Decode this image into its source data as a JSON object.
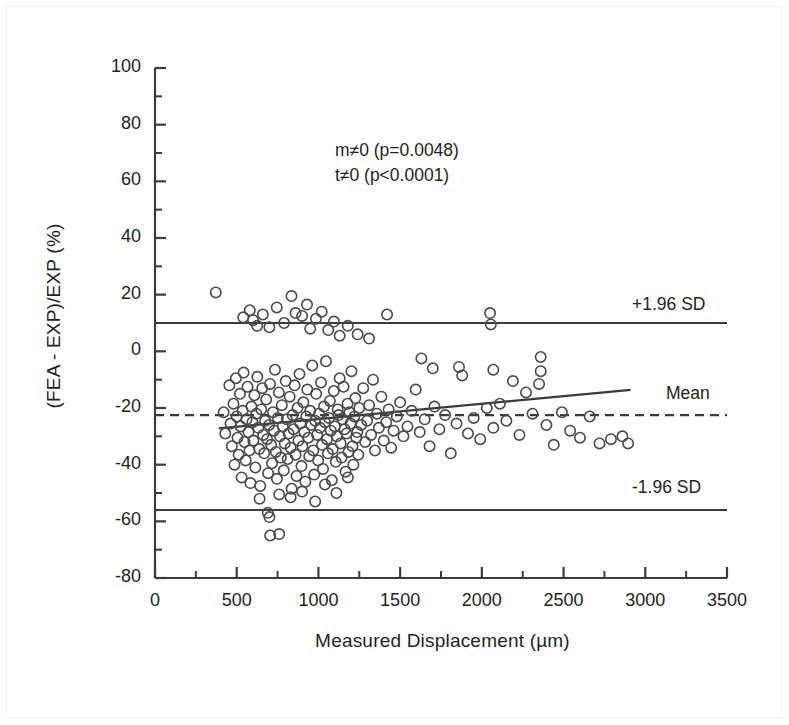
{
  "figure": {
    "border_color": "#f2f2f2",
    "background": "#ffffff",
    "ink_color": "#3b3b3b",
    "text_color": "#231f20"
  },
  "annotations": {
    "slope_test": "m≠0 (p=0.0048)",
    "intercept_test": "t≠0 (p<0.0001)"
  },
  "reference_labels": {
    "upper_sd": "+1.96 SD",
    "mean": "Mean",
    "lower_sd": "-1.96 SD"
  },
  "chart_data": {
    "type": "scatter",
    "title": "",
    "subtitle": "",
    "xlabel": "Measured Displacement (µm)",
    "ylabel": "(FEA - EXP)/EXP (%)",
    "xlim": [
      0,
      3500
    ],
    "ylim": [
      -80,
      100
    ],
    "xticks": [
      0,
      500,
      1000,
      1500,
      2000,
      2500,
      3000,
      3500
    ],
    "xtick_labels": [
      "0",
      "500",
      "1000",
      "1500",
      "2000",
      "2500",
      "3000",
      "3500"
    ],
    "x_minor_tick_interval": 250,
    "yticks": [
      100,
      80,
      60,
      40,
      20,
      0,
      -20,
      -40,
      -60,
      -80
    ],
    "ytick_labels": [
      "100",
      "80",
      "60",
      "40",
      "20",
      "0",
      "-20",
      "-40",
      "-60",
      "-80"
    ],
    "y_minor_tick_interval": 10,
    "grid": false,
    "legend": "none",
    "marker": {
      "shape": "open-circle",
      "radius_px": 5.2,
      "edge_color": "#4a4a4a",
      "fill": "none"
    },
    "reference_lines": [
      {
        "name": "upper_limit_of_agreement",
        "label": "+1.96 SD",
        "y": 10.0,
        "style": "solid"
      },
      {
        "name": "mean_bias",
        "label": "Mean",
        "y": -22.5,
        "style": "dashed"
      },
      {
        "name": "lower_limit_of_agreement",
        "label": "-1.96 SD",
        "y": -56.0,
        "style": "solid"
      }
    ],
    "regression_line": {
      "name": "least-squares fit",
      "x_start": 390,
      "y_start": -27.2,
      "x_end": 2910,
      "y_end": -13.6,
      "slope_per_um": 0.0054,
      "intercept": -29.3,
      "style": "solid"
    },
    "points": [
      [
        372,
        20.8
      ],
      [
        420,
        -21.5
      ],
      [
        430,
        -29.0
      ],
      [
        455,
        -12.0
      ],
      [
        462,
        -25.5
      ],
      [
        470,
        -33.5
      ],
      [
        480,
        -18.5
      ],
      [
        486,
        -40.0
      ],
      [
        495,
        -9.5
      ],
      [
        500,
        -23.0
      ],
      [
        505,
        -30.5
      ],
      [
        512,
        -36.5
      ],
      [
        520,
        -15.0
      ],
      [
        524,
        -26.5
      ],
      [
        530,
        -44.5
      ],
      [
        536,
        -21.0
      ],
      [
        542,
        -7.5
      ],
      [
        548,
        -32.0
      ],
      [
        555,
        -38.5
      ],
      [
        560,
        -24.0
      ],
      [
        566,
        -12.5
      ],
      [
        572,
        -28.5
      ],
      [
        578,
        -35.0
      ],
      [
        584,
        -46.5
      ],
      [
        590,
        -19.5
      ],
      [
        596,
        -25.0
      ],
      [
        602,
        -31.5
      ],
      [
        608,
        -15.5
      ],
      [
        614,
        -41.0
      ],
      [
        620,
        -22.0
      ],
      [
        626,
        -9.0
      ],
      [
        632,
        -27.0
      ],
      [
        638,
        -34.5
      ],
      [
        644,
        -47.5
      ],
      [
        650,
        -20.5
      ],
      [
        656,
        -13.0
      ],
      [
        662,
        -29.5
      ],
      [
        668,
        -36.0
      ],
      [
        674,
        -24.5
      ],
      [
        680,
        -17.0
      ],
      [
        686,
        -31.0
      ],
      [
        692,
        -43.0
      ],
      [
        698,
        -26.0
      ],
      [
        704,
        -11.5
      ],
      [
        710,
        -33.0
      ],
      [
        716,
        -39.5
      ],
      [
        722,
        -21.5
      ],
      [
        728,
        -28.0
      ],
      [
        734,
        -6.5
      ],
      [
        740,
        -35.5
      ],
      [
        746,
        -45.0
      ],
      [
        752,
        -23.5
      ],
      [
        758,
        -14.5
      ],
      [
        764,
        -30.0
      ],
      [
        770,
        -37.5
      ],
      [
        776,
        -19.0
      ],
      [
        782,
        -26.5
      ],
      [
        788,
        -42.0
      ],
      [
        794,
        -32.5
      ],
      [
        800,
        -10.5
      ],
      [
        806,
        -24.0
      ],
      [
        812,
        -38.0
      ],
      [
        818,
        -29.0
      ],
      [
        824,
        -16.0
      ],
      [
        830,
        -34.0
      ],
      [
        836,
        -48.5
      ],
      [
        842,
        -22.5
      ],
      [
        848,
        -27.5
      ],
      [
        854,
        -12.0
      ],
      [
        860,
        -36.5
      ],
      [
        866,
        -44.0
      ],
      [
        872,
        -20.0
      ],
      [
        878,
        -31.5
      ],
      [
        884,
        -8.0
      ],
      [
        890,
        -25.5
      ],
      [
        896,
        -40.5
      ],
      [
        902,
        -33.5
      ],
      [
        908,
        -18.0
      ],
      [
        914,
        -28.5
      ],
      [
        920,
        -46.0
      ],
      [
        926,
        -23.0
      ],
      [
        932,
        -13.5
      ],
      [
        938,
        -30.5
      ],
      [
        944,
        -37.0
      ],
      [
        950,
        -21.0
      ],
      [
        956,
        -26.0
      ],
      [
        962,
        -5.0
      ],
      [
        968,
        -35.0
      ],
      [
        974,
        -43.5
      ],
      [
        980,
        -24.5
      ],
      [
        986,
        -15.0
      ],
      [
        992,
        -29.5
      ],
      [
        998,
        -38.5
      ],
      [
        1004,
        -22.0
      ],
      [
        1010,
        -27.0
      ],
      [
        1016,
        -11.0
      ],
      [
        1022,
        -33.0
      ],
      [
        1028,
        -41.5
      ],
      [
        1034,
        -19.5
      ],
      [
        1040,
        -25.0
      ],
      [
        1046,
        -3.5
      ],
      [
        1052,
        -31.0
      ],
      [
        1058,
        -36.0
      ],
      [
        1064,
        -23.5
      ],
      [
        1070,
        -17.5
      ],
      [
        1076,
        -28.0
      ],
      [
        1082,
        -45.5
      ],
      [
        1088,
        -34.5
      ],
      [
        1094,
        -14.0
      ],
      [
        1100,
        -26.5
      ],
      [
        1106,
        -39.0
      ],
      [
        1112,
        -30.0
      ],
      [
        1118,
        -20.5
      ],
      [
        1124,
        -22.5
      ],
      [
        1130,
        -9.5
      ],
      [
        1136,
        -32.5
      ],
      [
        1142,
        -37.5
      ],
      [
        1148,
        -24.0
      ],
      [
        1154,
        -12.5
      ],
      [
        1160,
        -27.5
      ],
      [
        1166,
        -42.5
      ],
      [
        1172,
        -29.0
      ],
      [
        1178,
        -18.5
      ],
      [
        1184,
        -35.5
      ],
      [
        1190,
        -21.5
      ],
      [
        1196,
        -25.5
      ],
      [
        1202,
        -7.0
      ],
      [
        1208,
        -33.5
      ],
      [
        1214,
        -40.0
      ],
      [
        1220,
        -23.0
      ],
      [
        1226,
        -16.5
      ],
      [
        1232,
        -30.5
      ],
      [
        1238,
        -28.5
      ],
      [
        1244,
        -36.5
      ],
      [
        1250,
        -20.0
      ],
      [
        1262,
        -26.0
      ],
      [
        1274,
        -13.0
      ],
      [
        1286,
        -32.0
      ],
      [
        1298,
        -24.5
      ],
      [
        1310,
        -19.0
      ],
      [
        1322,
        -29.5
      ],
      [
        1334,
        -10.0
      ],
      [
        1346,
        -35.0
      ],
      [
        1358,
        -22.0
      ],
      [
        1370,
        -27.0
      ],
      [
        1385,
        -16.0
      ],
      [
        1400,
        -31.5
      ],
      [
        1415,
        -25.0
      ],
      [
        1430,
        -20.5
      ],
      [
        1445,
        -34.0
      ],
      [
        1460,
        -28.0
      ],
      [
        1480,
        -23.0
      ],
      [
        1500,
        -18.0
      ],
      [
        1520,
        -30.0
      ],
      [
        1545,
        -26.5
      ],
      [
        1570,
        -21.0
      ],
      [
        1595,
        -13.5
      ],
      [
        1620,
        -28.5
      ],
      [
        1650,
        -24.0
      ],
      [
        1680,
        -33.5
      ],
      [
        1710,
        -19.5
      ],
      [
        1740,
        -27.5
      ],
      [
        1775,
        -22.5
      ],
      [
        1810,
        -36.0
      ],
      [
        1845,
        -25.5
      ],
      [
        1880,
        -8.5
      ],
      [
        1915,
        -29.0
      ],
      [
        1950,
        -23.5
      ],
      [
        1990,
        -31.0
      ],
      [
        2030,
        -20.0
      ],
      [
        2050,
        13.5
      ],
      [
        2055,
        9.5
      ],
      [
        2070,
        -27.0
      ],
      [
        2110,
        -18.5
      ],
      [
        2150,
        -24.5
      ],
      [
        2190,
        -10.5
      ],
      [
        2230,
        -29.5
      ],
      [
        2270,
        -14.5
      ],
      [
        2310,
        -22.0
      ],
      [
        2350,
        -11.5
      ],
      [
        2360,
        -7.0
      ],
      [
        2395,
        -26.0
      ],
      [
        2440,
        -33.0
      ],
      [
        2490,
        -21.5
      ],
      [
        2540,
        -28.0
      ],
      [
        2600,
        -30.5
      ],
      [
        2660,
        -23.0
      ],
      [
        2720,
        -32.5
      ],
      [
        2790,
        -31.0
      ],
      [
        2860,
        -30.0
      ],
      [
        2895,
        -32.5
      ],
      [
        540,
        12.0
      ],
      [
        580,
        14.5
      ],
      [
        600,
        11.0
      ],
      [
        625,
        9.0
      ],
      [
        660,
        13.0
      ],
      [
        700,
        8.5
      ],
      [
        745,
        15.5
      ],
      [
        790,
        10.0
      ],
      [
        835,
        19.5
      ],
      [
        860,
        13.5
      ],
      [
        900,
        12.5
      ],
      [
        930,
        16.5
      ],
      [
        950,
        8.0
      ],
      [
        985,
        11.5
      ],
      [
        1020,
        14.0
      ],
      [
        1060,
        7.5
      ],
      [
        1095,
        10.5
      ],
      [
        1130,
        5.5
      ],
      [
        1180,
        9.0
      ],
      [
        1240,
        6.0
      ],
      [
        1310,
        4.5
      ],
      [
        1420,
        13.0
      ],
      [
        1630,
        -2.5
      ],
      [
        1700,
        -6.0
      ],
      [
        1860,
        -5.5
      ],
      [
        2070,
        -6.5
      ],
      [
        2360,
        -2.0
      ],
      [
        690,
        -57.0
      ],
      [
        700,
        -58.5
      ],
      [
        705,
        -65.0
      ],
      [
        760,
        -64.5
      ],
      [
        640,
        -52.0
      ],
      [
        760,
        -50.5
      ],
      [
        830,
        -51.5
      ],
      [
        900,
        -49.5
      ],
      [
        980,
        -53.0
      ],
      [
        1040,
        -47.0
      ],
      [
        1110,
        -50.0
      ],
      [
        1180,
        -44.5
      ]
    ],
    "point_count_approx": 230
  }
}
